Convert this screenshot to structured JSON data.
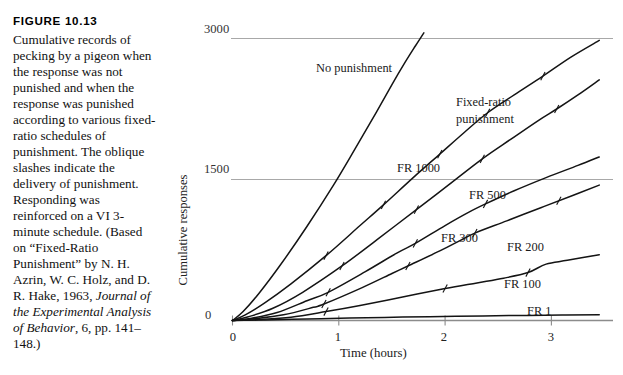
{
  "figure": {
    "number_label": "FIGURE 10.13",
    "caption_paragraph": "Cumulative records of pecking by a pigeon when the response was not punished and when the response was punished according to various fixed-ratio schedules of punishment. The oblique slashes indicate the delivery of punishment. Responding was reinforced on a VI 3-minute schedule. (Based on “Fixed-Ratio Punishment” by N. H. Azrin, W. C. Holz, and D. R. Hake, 1963, ",
    "caption_italic": "Journal of the Experimental Analysis of Behavior",
    "caption_tail": ", 6, pp. 141–148.)"
  },
  "chart_data": {
    "type": "line",
    "title": "",
    "xlabel": "Time (hours)",
    "ylabel": "Cumulative responses",
    "xlim": [
      -0.18,
      3.6
    ],
    "ylim": [
      0,
      3200
    ],
    "xticks": [
      0,
      1,
      2,
      3
    ],
    "xtick_labels": [
      "0",
      "1",
      "2",
      "3"
    ],
    "yticks": [
      0,
      1500,
      3000
    ],
    "ytick_labels": [
      "0",
      "1500",
      "3000"
    ],
    "grid": "horizontal-gridlines-at-1500-and-3000",
    "legend": "inline-curve-labels",
    "line_color": "#141414",
    "grid_color": "#a8a8a8",
    "axis_color": "#8c8c8c",
    "annotations": [
      {
        "text": "No punishment",
        "x": 0.79,
        "y": 2640
      },
      {
        "text": "Fixed-ratio",
        "x": 2.12,
        "y": 2290
      },
      {
        "text": "punishment",
        "x": 2.12,
        "y": 2130
      },
      {
        "text": "FR 1000",
        "x": 1.56,
        "y": 1610
      },
      {
        "text": "FR 500",
        "x": 2.24,
        "y": 1320
      },
      {
        "text": "FR 300",
        "x": 1.98,
        "y": 880
      },
      {
        "text": "FR 200",
        "x": 2.6,
        "y": 790
      },
      {
        "text": "FR 100",
        "x": 2.57,
        "y": 430
      },
      {
        "text": "FR 1",
        "x": 2.79,
        "y": 160
      }
    ],
    "series": [
      {
        "name": "No punishment",
        "label": "No punishment",
        "slash_marks_x": [],
        "x": [
          0.0,
          0.1,
          0.25,
          0.45,
          0.7,
          0.95,
          1.15,
          1.35,
          1.5,
          1.62,
          1.72,
          1.8
        ],
        "y": [
          0,
          95,
          290,
          590,
          1000,
          1440,
          1820,
          2210,
          2510,
          2740,
          2920,
          3060
        ]
      },
      {
        "name": "FR 1000",
        "label": "FR 1000",
        "slash_marks_x": [
          0.88,
          1.42,
          1.95,
          2.4,
          2.92
        ],
        "x": [
          0.0,
          0.12,
          0.3,
          0.55,
          0.88,
          1.2,
          1.42,
          1.7,
          1.95,
          2.18,
          2.4,
          2.65,
          2.92,
          3.18,
          3.45
        ],
        "y": [
          0,
          60,
          185,
          390,
          690,
          1010,
          1230,
          1520,
          1770,
          2000,
          2210,
          2400,
          2600,
          2800,
          2980
        ]
      },
      {
        "name": "FR 500",
        "label": "FR 500",
        "slash_marks_x": [
          1.03,
          1.73,
          2.35,
          3.05
        ],
        "x": [
          0.0,
          0.15,
          0.38,
          0.66,
          1.03,
          1.36,
          1.73,
          2.03,
          2.35,
          2.62,
          2.88,
          3.05,
          3.25,
          3.45
        ],
        "y": [
          0,
          40,
          130,
          300,
          580,
          860,
          1180,
          1440,
          1720,
          1930,
          2130,
          2250,
          2400,
          2560
        ]
      },
      {
        "name": "FR 300",
        "label": "FR 300",
        "slash_marks_x": [
          0.9,
          1.72,
          2.38
        ],
        "x": [
          0.0,
          0.18,
          0.42,
          0.7,
          0.9,
          1.25,
          1.55,
          1.72,
          2.0,
          2.22,
          2.38,
          2.65,
          2.95,
          3.25,
          3.45
        ],
        "y": [
          0,
          25,
          85,
          210,
          300,
          520,
          720,
          820,
          1010,
          1150,
          1240,
          1380,
          1520,
          1650,
          1740
        ]
      },
      {
        "name": "FR 200",
        "label": "FR 200",
        "slash_marks_x": [
          0.86,
          1.65,
          2.28,
          3.07
        ],
        "x": [
          0.0,
          0.2,
          0.48,
          0.76,
          0.86,
          1.22,
          1.5,
          1.65,
          1.95,
          2.14,
          2.28,
          2.58,
          2.9,
          3.2,
          3.45
        ],
        "y": [
          0,
          18,
          60,
          140,
          175,
          350,
          500,
          580,
          740,
          850,
          930,
          1060,
          1200,
          1330,
          1440
        ]
      },
      {
        "name": "FR 100",
        "label": "FR 100",
        "slash_marks_x": [
          0.88,
          2.0,
          2.78
        ],
        "x": [
          0.0,
          0.25,
          0.55,
          0.88,
          1.2,
          1.6,
          2.0,
          2.3,
          2.55,
          2.78,
          2.95,
          3.15,
          3.45
        ],
        "y": [
          0,
          10,
          35,
          95,
          160,
          250,
          340,
          400,
          450,
          510,
          600,
          640,
          700
        ]
      },
      {
        "name": "FR 1",
        "label": "FR 1",
        "slash_marks_x": [],
        "x": [
          0.0,
          0.3,
          0.7,
          1.1,
          1.6,
          2.1,
          2.6,
          3.1,
          3.45
        ],
        "y": [
          0,
          6,
          16,
          26,
          36,
          44,
          52,
          58,
          62
        ]
      }
    ]
  }
}
